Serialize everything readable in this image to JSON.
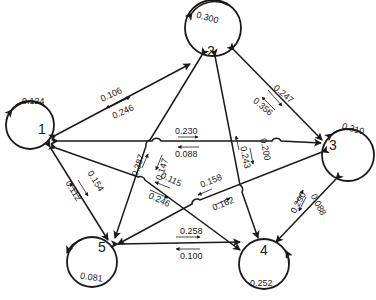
{
  "diagram": {
    "type": "state-transition-graph",
    "nodes": [
      {
        "id": "1",
        "label": "1",
        "self_loop": "0.124"
      },
      {
        "id": "2",
        "label": "2",
        "self_loop": "0.300"
      },
      {
        "id": "3",
        "label": "3",
        "self_loop": "0.310"
      },
      {
        "id": "4",
        "label": "4",
        "self_loop": "0.252"
      },
      {
        "id": "5",
        "label": "5",
        "self_loop": "0.081"
      }
    ],
    "edges": [
      {
        "pair": "1-2",
        "label_a": "0.106",
        "label_b": "0.246"
      },
      {
        "pair": "1-3",
        "label_a": "0.230",
        "label_b": "0.088"
      },
      {
        "pair": "1-4",
        "label_a": "0.115",
        "label_b": "0.246"
      },
      {
        "pair": "1-5",
        "label_a": "0.154",
        "label_b": "0.112"
      },
      {
        "pair": "2-3",
        "label_a": "0.247",
        "label_b": "0.356"
      },
      {
        "pair": "2-4",
        "label_a": "0.200",
        "label_b": "0.243"
      },
      {
        "pair": "2-5",
        "label_a": "0.387",
        "label_b": "0.147"
      },
      {
        "pair": "3-4",
        "label_a": "0.290",
        "label_b": "0.088"
      },
      {
        "pair": "3-5",
        "label_a": "0.158",
        "label_b": "0.162"
      },
      {
        "pair": "4-5",
        "label_a": "0.258",
        "label_b": "0.100"
      }
    ]
  }
}
